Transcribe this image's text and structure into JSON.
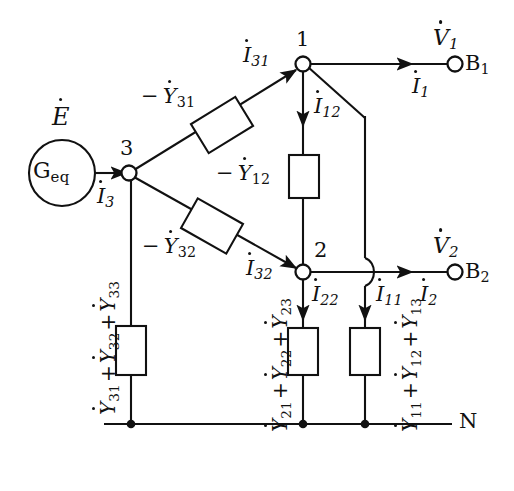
{
  "diagram": {
    "type": "circuit-schematic",
    "source": {
      "emf_label": "E",
      "conductance_label": "G",
      "conductance_sub": "eq",
      "current_label": "I",
      "current_sub": "3"
    },
    "nodes": [
      {
        "id": "n3",
        "label": "3",
        "x": 129,
        "y": 173
      },
      {
        "id": "n1",
        "label": "1",
        "x": 303,
        "y": 64
      },
      {
        "id": "n2",
        "label": "2",
        "x": 303,
        "y": 272
      }
    ],
    "terminals": [
      {
        "id": "b1",
        "label": "B",
        "sub": "1",
        "voltage": "V",
        "voltage_sub": "1",
        "current": "I",
        "current_sub": "1",
        "x": 455,
        "y": 66
      },
      {
        "id": "b2",
        "label": "B",
        "sub": "2",
        "voltage": "V",
        "voltage_sub": "2",
        "current": "I",
        "current_sub": "2",
        "x": 455,
        "y": 272
      }
    ],
    "neutral_label": "N",
    "branch_admittances": [
      {
        "id": "y31",
        "label": "Y",
        "sub": "31",
        "sign": "−",
        "orientation": "diagonal-up"
      },
      {
        "id": "y32",
        "label": "Y",
        "sub": "32",
        "sign": "−",
        "orientation": "diagonal-down"
      },
      {
        "id": "y12",
        "label": "Y",
        "sub": "12",
        "sign": "−",
        "orientation": "vertical"
      }
    ],
    "shunt_admittances": [
      {
        "id": "shunt3",
        "terms": [
          "Y",
          "Y",
          "Y"
        ],
        "subs": [
          "31",
          "32",
          "33"
        ],
        "text": "31 + 32 + 33"
      },
      {
        "id": "shunt2",
        "terms": [
          "Y",
          "Y",
          "Y"
        ],
        "subs": [
          "21",
          "22",
          "23"
        ],
        "text": "21 + 22 + 23"
      },
      {
        "id": "shunt1",
        "terms": [
          "Y",
          "Y",
          "Y"
        ],
        "subs": [
          "11",
          "12",
          "13"
        ],
        "text": "11 + 12 + 13"
      }
    ],
    "branch_currents": [
      {
        "id": "i31",
        "label": "I",
        "sub": "31"
      },
      {
        "id": "i32",
        "label": "I",
        "sub": "32"
      },
      {
        "id": "i12",
        "label": "I",
        "sub": "12"
      },
      {
        "id": "i22",
        "label": "I",
        "sub": "22"
      },
      {
        "id": "i11",
        "label": "I",
        "sub": "11"
      },
      {
        "id": "i3",
        "label": "I",
        "sub": "3"
      },
      {
        "id": "i1",
        "label": "I",
        "sub": "1"
      },
      {
        "id": "i2",
        "label": "I",
        "sub": "2"
      }
    ],
    "colors": {
      "line": "#111111",
      "background": "#ffffff",
      "text": "#111111"
    }
  }
}
